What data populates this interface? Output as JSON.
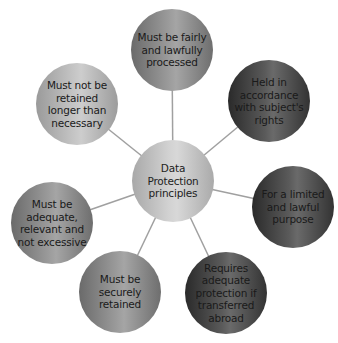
{
  "diagram": {
    "center": {
      "label": "Data Protection principles"
    },
    "principles": [
      {
        "label": "Must be fairly and lawfully processed"
      },
      {
        "label": "Held in accordance with subject's rights"
      },
      {
        "label": "For a limited and lawful purpose"
      },
      {
        "label": "Requires adequate protection if transferred abroad"
      },
      {
        "label": "Must be securely retained"
      },
      {
        "label": "Must be adequate, relevant and not excessive"
      },
      {
        "label": "Must not be retained longer than necessary"
      }
    ],
    "colors": {
      "dark": "#3a3a3a",
      "mid": "#8a8a8a",
      "light": "#b5b5b5",
      "connector": "#a0a0a0"
    }
  }
}
